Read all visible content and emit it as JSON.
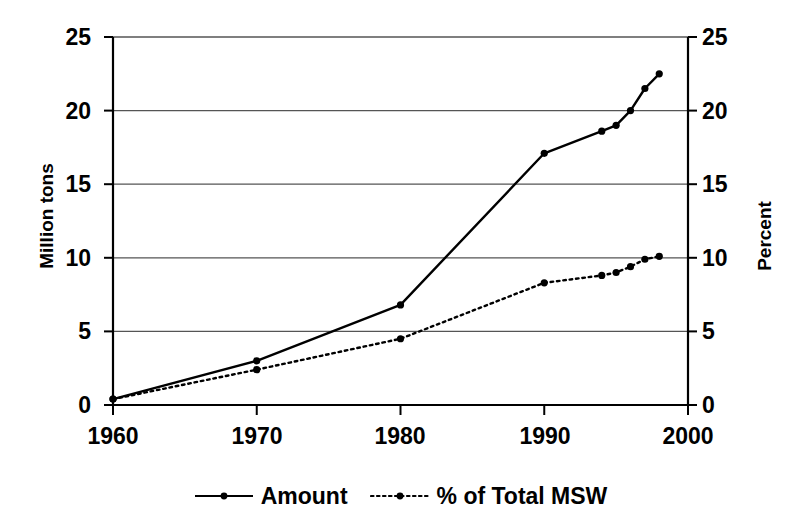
{
  "chart_data": {
    "type": "line",
    "title": "",
    "xlabel": "",
    "ylabel": "Million tons",
    "y2label": "Percent",
    "xlim": [
      1960,
      2000
    ],
    "ylim": [
      0,
      25
    ],
    "y2lim": [
      0,
      25
    ],
    "grid": true,
    "legend_position": "bottom",
    "x_ticks": [
      "1960",
      "1970",
      "1980",
      "1990",
      "2000"
    ],
    "x_tick_values": [
      1960,
      1970,
      1980,
      1990,
      2000
    ],
    "y_ticks_left": [
      "0",
      "5",
      "10",
      "15",
      "20",
      "25"
    ],
    "y_tick_values_left": [
      0,
      5,
      10,
      15,
      20,
      25
    ],
    "y_ticks_right": [
      "0",
      "5",
      "10",
      "15",
      "20",
      "25"
    ],
    "y_tick_values_right": [
      0,
      5,
      10,
      15,
      20,
      25
    ],
    "series": [
      {
        "name": "Amount",
        "axis": "left",
        "style": "solid",
        "marker": "dot",
        "x": [
          1960,
          1970,
          1980,
          1990,
          1994,
          1995,
          1996,
          1997,
          1998
        ],
        "values": [
          0.4,
          3.0,
          6.8,
          17.1,
          18.6,
          19.0,
          20.0,
          21.5,
          22.5
        ]
      },
      {
        "name": "% of Total MSW",
        "axis": "right",
        "style": "dotted",
        "marker": "dot",
        "x": [
          1960,
          1970,
          1980,
          1990,
          1994,
          1995,
          1996,
          1997,
          1998
        ],
        "values": [
          0.4,
          2.4,
          4.5,
          8.3,
          8.8,
          9.0,
          9.4,
          9.9,
          10.1
        ]
      }
    ]
  },
  "legend": {
    "items": [
      {
        "label": "Amount",
        "style": "solid"
      },
      {
        "label": "% of Total MSW",
        "style": "dotted"
      }
    ]
  },
  "colors": {
    "line": "#000000",
    "grid": "#555555",
    "axis": "#000000",
    "background": "#ffffff"
  }
}
